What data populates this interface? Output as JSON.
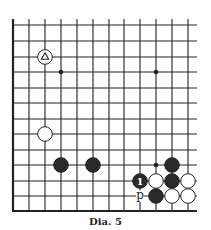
{
  "diagram": {
    "caption": "Dia. 5",
    "board": {
      "columns_x": [
        13,
        29,
        45,
        61,
        77,
        93,
        109,
        124,
        140,
        156,
        172,
        188
      ],
      "rows_y": [
        25,
        41,
        57,
        72,
        88,
        103,
        119,
        134,
        150,
        165,
        181,
        196,
        211
      ],
      "left_edge": true,
      "bottom_edge": true,
      "line_color": "#222222",
      "stone_black": "#2a2a2a",
      "stone_white": "#ffffff"
    },
    "star_points": [
      {
        "col": 3,
        "row": 3
      },
      {
        "col": 9,
        "row": 3
      },
      {
        "col": 9,
        "row": 9
      }
    ],
    "stones": [
      {
        "color": "white",
        "col": 2,
        "row": 2,
        "mark": "triangle"
      },
      {
        "color": "white",
        "col": 2,
        "row": 7
      },
      {
        "color": "black",
        "col": 3,
        "row": 9
      },
      {
        "color": "black",
        "col": 5,
        "row": 9
      },
      {
        "color": "black",
        "col": 10,
        "row": 9
      },
      {
        "color": "black",
        "col": 8,
        "row": 10,
        "label": "1"
      },
      {
        "color": "white",
        "col": 9,
        "row": 10
      },
      {
        "color": "black",
        "col": 10,
        "row": 10
      },
      {
        "color": "white",
        "col": 11,
        "row": 10
      },
      {
        "color": "black",
        "col": 9,
        "row": 11
      },
      {
        "color": "white",
        "col": 10,
        "row": 11
      },
      {
        "color": "white",
        "col": 11,
        "row": 11
      }
    ],
    "point_labels": [
      {
        "text": "p",
        "col": 8,
        "row": 11
      }
    ]
  }
}
